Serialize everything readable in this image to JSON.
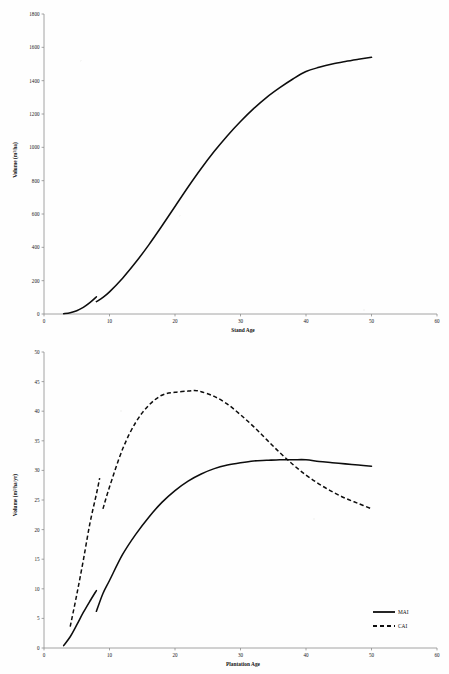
{
  "document": {
    "background_color": "#fefefe",
    "ink_color": "#0d0d0d",
    "axis_color": "#8d8d8d"
  },
  "chart_data": [
    {
      "id": "standing-volume",
      "type": "line",
      "title": "",
      "xlabel": "Stand Age",
      "ylabel": "Volume (m³/ha)",
      "xlim": [
        0,
        60
      ],
      "ylim": [
        0,
        1800
      ],
      "xticks": [
        0,
        10,
        20,
        30,
        40,
        50,
        60
      ],
      "xticklabels": [
        "0",
        "10",
        "20",
        "30",
        "40",
        "50",
        "60"
      ],
      "yticks": [
        0,
        200,
        400,
        600,
        800,
        1000,
        1200,
        1400,
        1600,
        1800
      ],
      "yticklabels": [
        "0",
        "200",
        "400",
        "600",
        "800",
        "1000",
        "1200",
        "1400",
        "1600",
        "1800"
      ],
      "grid": false,
      "legend": "none",
      "series": [
        {
          "name": "Standing Volume",
          "style": "solid",
          "note": "thinning drop at age 8",
          "segments": [
            {
              "x": [
                3,
                4,
                5,
                6,
                7,
                8
              ],
              "y": [
                2,
                8,
                20,
                40,
                68,
                103
              ]
            },
            {
              "x": [
                8,
                9,
                10,
                12,
                14,
                16,
                18,
                20,
                22,
                24,
                26,
                28,
                30,
                32,
                34,
                36,
                38,
                40,
                42,
                44,
                46,
                48,
                50
              ],
              "y": [
                74,
                100,
                133,
                215,
                310,
                415,
                528,
                645,
                762,
                873,
                976,
                1070,
                1155,
                1232,
                1300,
                1358,
                1410,
                1455,
                1480,
                1500,
                1515,
                1528,
                1540
              ]
            }
          ]
        }
      ]
    },
    {
      "id": "increment-curves",
      "type": "line",
      "title": "",
      "xlabel": "Plantation Age",
      "ylabel": "Volume (m³/ha/yr)",
      "xlim": [
        0,
        60
      ],
      "ylim": [
        0,
        50
      ],
      "xticks": [
        0,
        10,
        20,
        30,
        40,
        50,
        60
      ],
      "xticklabels": [
        "0",
        "10",
        "20",
        "30",
        "40",
        "50",
        "60"
      ],
      "yticks": [
        0,
        5,
        10,
        15,
        20,
        25,
        30,
        35,
        40,
        45,
        50
      ],
      "yticklabels": [
        "0",
        "5",
        "10",
        "15",
        "20",
        "25",
        "30",
        "35",
        "40",
        "45",
        "50"
      ],
      "grid": false,
      "legend": "lower-right",
      "series": [
        {
          "name": "MAI",
          "style": "solid",
          "note": "mean annual increment; thinning drop at age 8",
          "segments": [
            {
              "x": [
                3,
                4,
                5,
                6,
                7,
                8
              ],
              "y": [
                0.4,
                1.9,
                3.9,
                6.0,
                7.9,
                9.7
              ]
            },
            {
              "x": [
                8,
                9,
                10,
                12,
                14,
                16,
                18,
                20,
                22,
                24,
                26,
                28,
                30,
                32,
                34,
                36,
                38,
                40,
                42,
                44,
                46,
                48,
                50
              ],
              "y": [
                6.2,
                9.2,
                11.4,
                15.8,
                19.2,
                22.1,
                24.6,
                26.6,
                28.2,
                29.4,
                30.3,
                30.9,
                31.3,
                31.6,
                31.7,
                31.8,
                31.8,
                31.8,
                31.5,
                31.3,
                31.1,
                30.9,
                30.7
              ]
            }
          ]
        },
        {
          "name": "CAI",
          "style": "dashed",
          "note": "current annual increment; thinning drop at age 8",
          "segments": [
            {
              "x": [
                4,
                5,
                6,
                7,
                8,
                8.5
              ],
              "y": [
                3.6,
                9.0,
                14.8,
                21.0,
                26.0,
                28.7
              ]
            },
            {
              "x": [
                9,
                10,
                12,
                14,
                16,
                18,
                20,
                22,
                23,
                24,
                26,
                28,
                30,
                32,
                34,
                36,
                38,
                40,
                42,
                44,
                46,
                48,
                50
              ],
              "y": [
                23.5,
                27.2,
                33.6,
                38.1,
                41.0,
                42.7,
                43.2,
                43.4,
                43.5,
                43.3,
                42.5,
                41.2,
                39.4,
                37.4,
                35.2,
                33.0,
                31.0,
                29.2,
                27.7,
                26.4,
                25.3,
                24.4,
                23.5
              ]
            }
          ]
        }
      ]
    }
  ],
  "legend": {
    "items": [
      {
        "label": "MAI",
        "style": "solid"
      },
      {
        "label": "CAI",
        "style": "dashed"
      }
    ]
  }
}
